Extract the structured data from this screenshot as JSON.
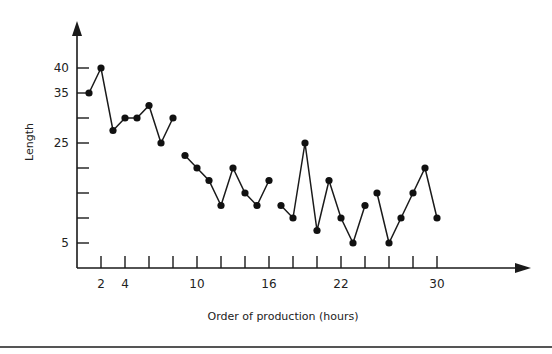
{
  "chart_data": {
    "type": "line",
    "title": "",
    "xlabel": "Order of production (hours)",
    "ylabel": "Length",
    "xlim": [
      0,
      38
    ],
    "ylim": [
      0,
      45
    ],
    "grid": false,
    "legend": null,
    "x_ticks": [
      2,
      4,
      6,
      8,
      10,
      12,
      14,
      16,
      18,
      20,
      22,
      24,
      26,
      28,
      30
    ],
    "x_tick_labels": [
      {
        "value": 2,
        "label": "2"
      },
      {
        "value": 4,
        "label": "4"
      },
      {
        "value": 10,
        "label": "10"
      },
      {
        "value": 16,
        "label": "16"
      },
      {
        "value": 22,
        "label": "22"
      },
      {
        "value": 30,
        "label": "30"
      }
    ],
    "y_ticks": [
      5,
      10,
      15,
      20,
      25,
      30,
      35,
      40
    ],
    "y_tick_labels": [
      {
        "value": 40,
        "label": "40"
      },
      {
        "value": 35,
        "label": "35"
      },
      {
        "value": 25,
        "label": "25"
      },
      {
        "value": 5,
        "label": "5"
      }
    ],
    "series": [
      {
        "name": "segment-1",
        "x": [
          1,
          2,
          3,
          4,
          5,
          6,
          7,
          8
        ],
        "values": [
          35,
          40,
          27.5,
          30,
          30,
          32.5,
          25,
          30
        ]
      },
      {
        "name": "segment-2",
        "x": [
          9,
          10,
          11,
          12,
          13,
          14,
          15,
          16
        ],
        "values": [
          22.5,
          20,
          17.5,
          12.5,
          20,
          15,
          12.5,
          17.5
        ]
      },
      {
        "name": "segment-3",
        "x": [
          17,
          18,
          19,
          20,
          21,
          22,
          23,
          24
        ],
        "values": [
          12.5,
          10,
          25,
          7.5,
          17.5,
          10,
          5,
          12.5
        ]
      },
      {
        "name": "segment-4",
        "x": [
          25,
          26,
          27,
          28,
          29,
          30
        ],
        "values": [
          15,
          5,
          10,
          15,
          20,
          10
        ]
      }
    ]
  },
  "colors": {
    "ink": "#1a1a1a",
    "background": "#ffffff",
    "rule": "#555555"
  }
}
